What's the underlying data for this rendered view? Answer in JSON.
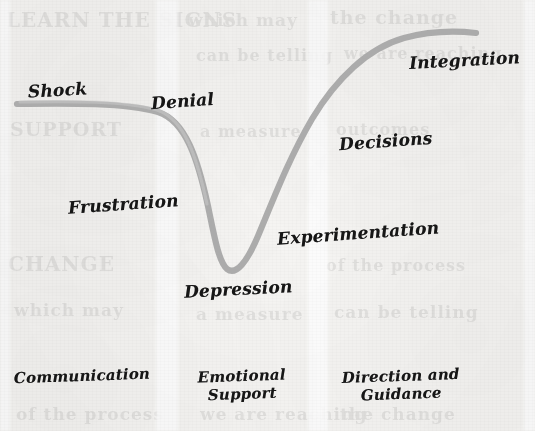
{
  "diagram": {
    "curve_color": "#a6a6a6",
    "text_color": "#161616",
    "background_color": "#f7f6f4",
    "stage_labels": [
      {
        "id": "shock",
        "text": "Shock"
      },
      {
        "id": "denial",
        "text": "Denial"
      },
      {
        "id": "frustration",
        "text": "Frustration"
      },
      {
        "id": "depression",
        "text": "Depression"
      },
      {
        "id": "experimentation",
        "text": "Experimentation"
      },
      {
        "id": "decisions",
        "text": "Decisions"
      },
      {
        "id": "integration",
        "text": "Integration"
      }
    ],
    "footer_labels": [
      {
        "id": "communication",
        "text": "Communication"
      },
      {
        "id": "emotional-support",
        "text": "Emotional\nSupport"
      },
      {
        "id": "direction-guidance",
        "text": "Direction and\nGuidance"
      }
    ],
    "footer_line1": [
      "Communication",
      "Emotional",
      "Direction and"
    ],
    "footer_line2": [
      "",
      "Support",
      "Guidance"
    ],
    "ghost_text": [
      "LEARN THE SIGNS",
      "which may",
      "the change",
      "can be telling",
      "we are reaching",
      "SUPPORT",
      "a measure",
      "outcomes",
      "CHANGE",
      "of the process"
    ]
  }
}
